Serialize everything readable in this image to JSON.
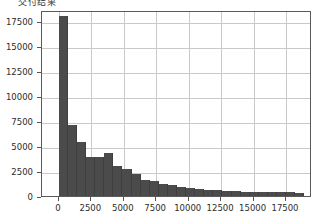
{
  "title": "交付结果",
  "chart_data": {
    "type": "bar",
    "title": "交付结果",
    "xlabel": "",
    "ylabel": "",
    "xlim": [
      -1300,
      19500
    ],
    "ylim": [
      0,
      18600
    ],
    "grid": true,
    "legend": false,
    "bar_color": "#4b4b4b",
    "grid_color": "#c9c9c9",
    "axis_color": "#5a5a5a",
    "bin_width": 700,
    "x_ticks": [
      0,
      2500,
      5000,
      7500,
      10000,
      12500,
      15000,
      17500
    ],
    "x_tick_labels": [
      "0",
      "2500",
      "5000",
      "7500",
      "10000",
      "12500",
      "15000",
      "17500"
    ],
    "y_ticks": [
      0,
      2500,
      5000,
      7500,
      10000,
      12500,
      15000,
      17500
    ],
    "y_tick_labels": [
      "0",
      "2500",
      "5000",
      "7500",
      "10000",
      "12500",
      "15000",
      "17500"
    ],
    "bin_starts": [
      0,
      700,
      1400,
      2100,
      2800,
      3500,
      4200,
      4900,
      5600,
      6300,
      7000,
      7700,
      8400,
      9100,
      9800,
      10500,
      11200,
      11900,
      12600,
      13300,
      14000,
      14700,
      15400,
      16100,
      16800,
      17500,
      18200
    ],
    "categories": [
      "0",
      "700",
      "1400",
      "2100",
      "2800",
      "3500",
      "4200",
      "4900",
      "5600",
      "6300",
      "7000",
      "7700",
      "8400",
      "9100",
      "9800",
      "10500",
      "11200",
      "11900",
      "12600",
      "13300",
      "14000",
      "14700",
      "15400",
      "16100",
      "16800",
      "17500",
      "18200"
    ],
    "values": [
      18000,
      7150,
      5450,
      3900,
      3950,
      4300,
      3000,
      2700,
      2200,
      1650,
      1500,
      1250,
      1100,
      900,
      850,
      700,
      620,
      560,
      500,
      470,
      440,
      420,
      400,
      380,
      370,
      360,
      340
    ]
  }
}
